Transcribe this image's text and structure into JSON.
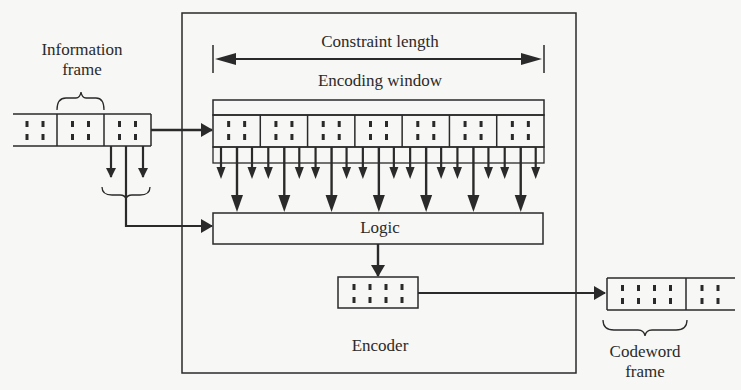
{
  "diagram": {
    "title_labels": {
      "information_frame": [
        "Information",
        "frame"
      ],
      "constraint_length": "Constraint length",
      "encoding_window": "Encoding window",
      "logic": "Logic",
      "encoder": "Encoder",
      "codeword_frame": [
        "Codeword",
        "frame"
      ]
    },
    "information_tape": {
      "frames_visible": 3,
      "bits_per_frame": 2
    },
    "encoding_window": {
      "cells": 7,
      "bits_per_cell": 2,
      "taps_per_cell": 3
    },
    "encoder_output_register": {
      "bits": 4
    },
    "codeword_tape": {
      "frames_visible": 2,
      "first_frame_bits": 4,
      "second_frame_bits": 2
    },
    "colors": {
      "line": "#2a2a2a",
      "background": "#f7f7f5"
    }
  }
}
